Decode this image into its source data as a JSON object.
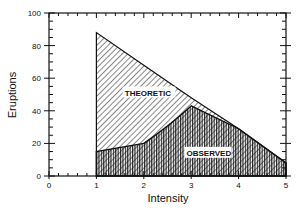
{
  "chart_data": {
    "type": "area",
    "title": "",
    "xlabel": "Intensity",
    "ylabel": "Eruptions",
    "xlim": [
      0,
      5
    ],
    "ylim": [
      0,
      100
    ],
    "xticks": [
      0,
      1,
      2,
      3,
      4,
      5
    ],
    "yticks": [
      0,
      20,
      40,
      60,
      80,
      100
    ],
    "grid": false,
    "series": [
      {
        "name": "THEORETIC",
        "pattern": "diagonal-hatch",
        "x": [
          1,
          2,
          3,
          4,
          5
        ],
        "values": [
          88,
          68,
          48,
          29,
          8
        ]
      },
      {
        "name": "OBSERVED",
        "pattern": "vertical-hatch",
        "x": [
          1,
          2,
          3,
          4,
          5
        ],
        "values": [
          15,
          20,
          43,
          29,
          8
        ]
      }
    ],
    "annotations": [
      {
        "text": "THEORETIC",
        "x": 1.6,
        "y": 50
      },
      {
        "text": "OBSERVED",
        "x": 2.9,
        "y": 13
      }
    ]
  },
  "labels": {
    "x_axis": "Intensity",
    "y_axis": "Eruptions",
    "theoretic": "THEORETIC",
    "observed": "OBSERVED"
  }
}
